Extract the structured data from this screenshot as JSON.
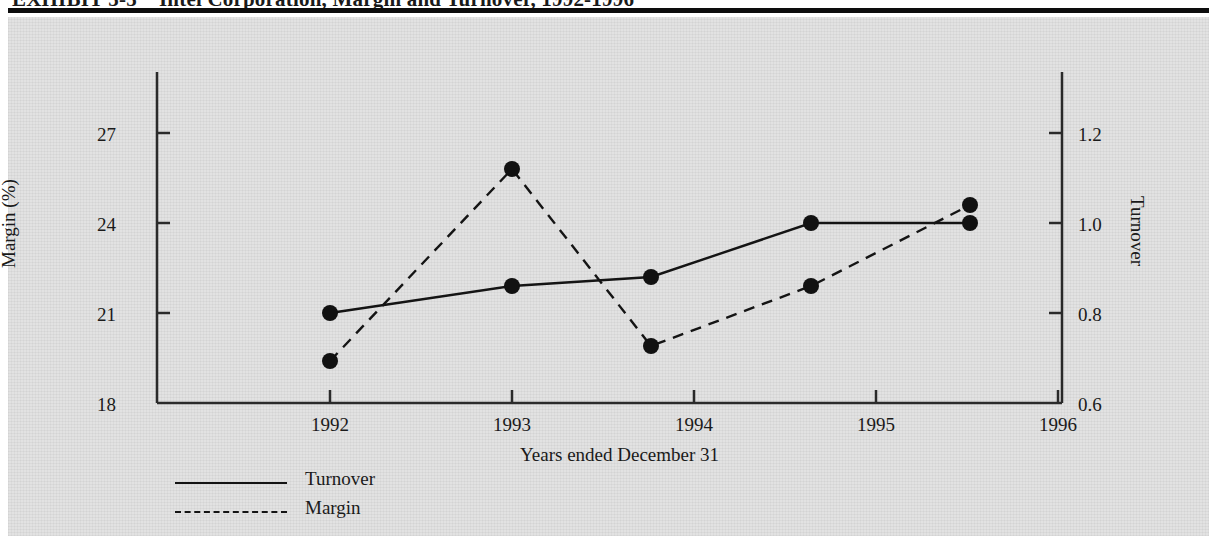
{
  "exhibit": {
    "label": "EXHIBIT 5-5",
    "title": "Intel Corporation, Margin and Turnover, 1992-1996"
  },
  "axes": {
    "left": {
      "title": "Margin (%)",
      "ticks": [
        "18",
        "21",
        "24",
        "27"
      ],
      "min": 18,
      "max": 28.5
    },
    "right": {
      "title": "Turnover",
      "ticks": [
        "0.6",
        "0.8",
        "1.0",
        "1.2"
      ],
      "min": 0.6,
      "max": 1.3
    },
    "x": {
      "title": "Years ended December 31",
      "ticks": [
        "1992",
        "1993",
        "1994",
        "1995",
        "1996"
      ]
    }
  },
  "legend": [
    {
      "label": "Turnover",
      "style": "solid"
    },
    {
      "label": "Margin",
      "style": "dashed"
    }
  ],
  "colors": {
    "line": "#141414",
    "marker": "#111111",
    "panel": "#e2e2e2",
    "rule": "#0d0d0d",
    "text": "#1a1a1a"
  },
  "chart_data": {
    "type": "line",
    "title": "Intel Corporation, Margin and Turnover, 1992-1996",
    "xlabel": "Years ended December 31",
    "ylabel": "Margin (%)",
    "y2label": "Turnover",
    "categories": [
      "1992",
      "1993",
      "1994",
      "1995",
      "1996"
    ],
    "ylim": [
      18,
      28.5
    ],
    "y2lim": [
      0.6,
      1.3
    ],
    "grid": false,
    "legend_position": "bottom-left",
    "series": [
      {
        "name": "Turnover",
        "axis": "right",
        "style": "solid",
        "marker": "filled-circle",
        "values": [
          0.8,
          0.86,
          0.88,
          1.0,
          1.0
        ]
      },
      {
        "name": "Margin",
        "axis": "left",
        "style": "dashed",
        "marker": "filled-circle",
        "values": [
          19.4,
          25.8,
          19.9,
          21.9,
          24.6
        ]
      }
    ]
  }
}
